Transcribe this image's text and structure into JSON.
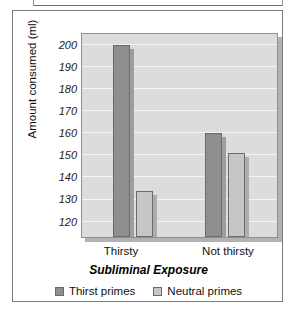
{
  "chart_data": {
    "type": "bar",
    "title": "",
    "categories": [
      "Thirsty",
      "Not thirsty"
    ],
    "series": [
      {
        "name": "Thirst primes",
        "values": [
          200,
          160
        ],
        "color": "#8f8f8f"
      },
      {
        "name": "Neutral primes",
        "values": [
          134,
          151
        ],
        "color": "#c6c6c6"
      }
    ],
    "xlabel": "Subliminal Exposure",
    "ylabel": "Amount consumed (ml)",
    "ylim": [
      113,
      205
    ],
    "yticks": [
      120,
      130,
      140,
      150,
      160,
      170,
      180,
      190,
      200
    ],
    "ytick_labels": [
      "120",
      "130",
      "140",
      "150",
      "160",
      "170",
      "180",
      "190",
      "200"
    ],
    "grid": true,
    "legend_position": "bottom",
    "plot_background": "#dcdcdc",
    "gridline_color": "#f4f4f4"
  },
  "legend": {
    "items": [
      {
        "label": "Thirst primes"
      },
      {
        "label": "Neutral primes"
      }
    ]
  },
  "axes": {
    "x_title": "Subliminal Exposure",
    "y_title": "Amount consumed (ml)",
    "x_tick_0": "Thirsty",
    "x_tick_1": "Not thirsty"
  }
}
